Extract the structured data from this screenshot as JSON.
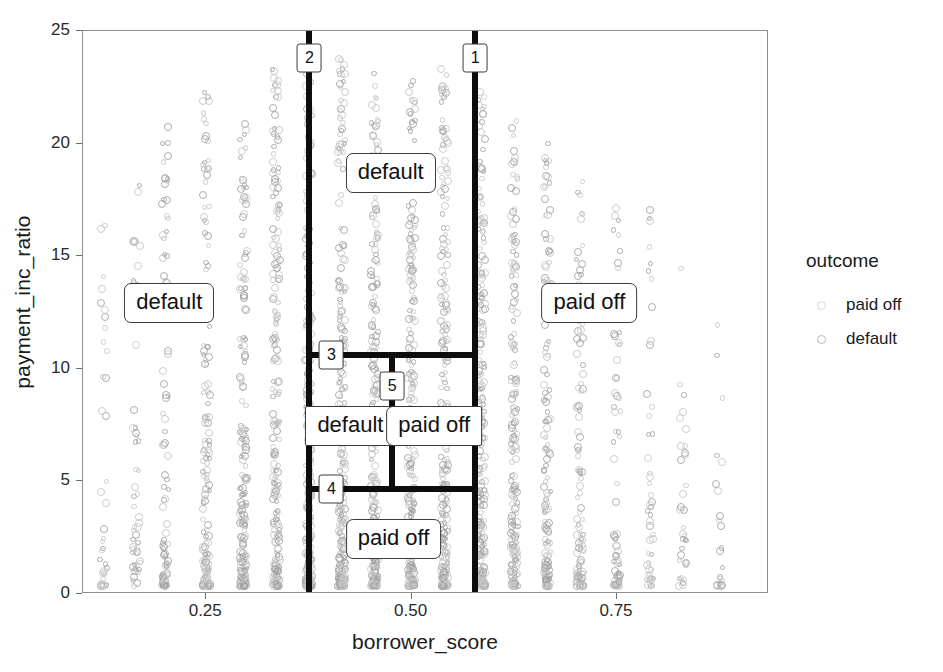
{
  "chart_data": {
    "type": "scatter",
    "title": "",
    "xlabel": "borrower_score",
    "ylabel": "payment_inc_ratio",
    "xlim": [
      0.1,
      0.935
    ],
    "ylim": [
      0,
      25
    ],
    "xticks": [
      0.25,
      0.5,
      0.75
    ],
    "xtick_labels": [
      "0.25",
      "0.50",
      "0.75"
    ],
    "yticks": [
      0,
      5,
      10,
      15,
      20,
      25
    ],
    "ytick_labels": [
      "0",
      "5",
      "10",
      "15",
      "20",
      "25"
    ],
    "grid": false,
    "legend": {
      "title": "outcome",
      "position": "right",
      "entries": [
        {
          "label": "paid off",
          "marker": "open-circle",
          "color": "#d9d9d9"
        },
        {
          "label": "default",
          "marker": "open-circle",
          "color": "#b9b9b9"
        }
      ]
    },
    "series": [
      {
        "name": "paid off",
        "marker": "open-circle",
        "color": "#d9d9d9",
        "x_clusters": [
          0.125,
          0.165,
          0.2,
          0.25,
          0.295,
          0.335,
          0.375,
          0.415,
          0.455,
          0.5,
          0.54,
          0.585,
          0.625,
          0.665,
          0.705,
          0.75,
          0.79,
          0.83,
          0.875
        ],
        "note": "borrower_score is discretized; points form vertical stripes"
      },
      {
        "name": "default",
        "marker": "open-circle",
        "color": "#bdbdbd",
        "x_clusters": [
          0.125,
          0.165,
          0.2,
          0.25,
          0.295,
          0.335,
          0.375,
          0.415,
          0.455,
          0.5,
          0.54,
          0.585,
          0.625,
          0.665,
          0.705,
          0.75,
          0.79,
          0.83,
          0.875
        ]
      }
    ],
    "decision_tree": {
      "splits": [
        {
          "id": "1",
          "orientation": "vertical",
          "value": 0.5775,
          "y_from": 0,
          "y_to": 25,
          "label": "1"
        },
        {
          "id": "2",
          "orientation": "vertical",
          "value": 0.3755,
          "y_from": 0,
          "y_to": 25,
          "label": "2"
        },
        {
          "id": "3",
          "orientation": "horizontal",
          "value": 10.62,
          "x_from": 0.3755,
          "x_to": 0.5775,
          "label": "3"
        },
        {
          "id": "4",
          "orientation": "horizontal",
          "value": 4.66,
          "x_from": 0.3755,
          "x_to": 0.5775,
          "label": "4"
        },
        {
          "id": "5",
          "orientation": "vertical",
          "value": 0.4765,
          "y_from": 4.66,
          "y_to": 10.62,
          "label": "5"
        }
      ],
      "leaves": [
        {
          "label": "default",
          "x": 0.205,
          "y": 12.9
        },
        {
          "label": "default",
          "x": 0.4745,
          "y": 18.7
        },
        {
          "label": "default",
          "x": 0.4255,
          "y": 7.45
        },
        {
          "label": "paid off",
          "x": 0.5275,
          "y": 7.45
        },
        {
          "label": "paid off",
          "x": 0.478,
          "y": 2.45
        },
        {
          "label": "paid off",
          "x": 0.7165,
          "y": 12.9
        }
      ]
    }
  }
}
